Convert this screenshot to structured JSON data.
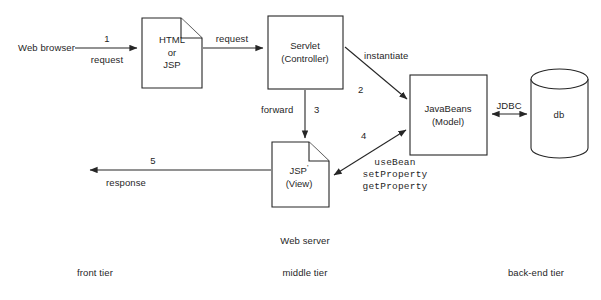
{
  "diagram": {
    "stroke_color": "#262626",
    "background": "#ffffff",
    "nodes": {
      "web_browser": {
        "label": "Web browser"
      },
      "html_jsp": {
        "line1": "HTML",
        "line2": "or",
        "line3": "JSP"
      },
      "servlet": {
        "line1": "Servlet",
        "line2": "(Controller)"
      },
      "javabeans": {
        "line1": "JavaBeans",
        "line2": "(Model)"
      },
      "jsp_view": {
        "line1": "JSP",
        "prime": "'",
        "line2": "(View)"
      },
      "db": {
        "label": "db"
      }
    },
    "edges": {
      "browser_to_html": {
        "number": "1",
        "label": "request"
      },
      "html_to_servlet": {
        "label": "request"
      },
      "servlet_to_beans": {
        "number": "2",
        "label": "instantiate"
      },
      "servlet_to_jsp": {
        "number": "3",
        "label": "forward"
      },
      "jsp_to_beans": {
        "number": "4",
        "api_line1": "useBean",
        "api_line2": "setProperty",
        "api_line3": "getProperty"
      },
      "jsp_to_browser": {
        "number": "5",
        "label": "response"
      },
      "beans_to_db": {
        "label": "JDBC"
      }
    },
    "annotations": {
      "web_server": "Web server"
    },
    "tiers": {
      "front": "front tier",
      "middle": "middle tier",
      "back": "back-end tier"
    }
  }
}
